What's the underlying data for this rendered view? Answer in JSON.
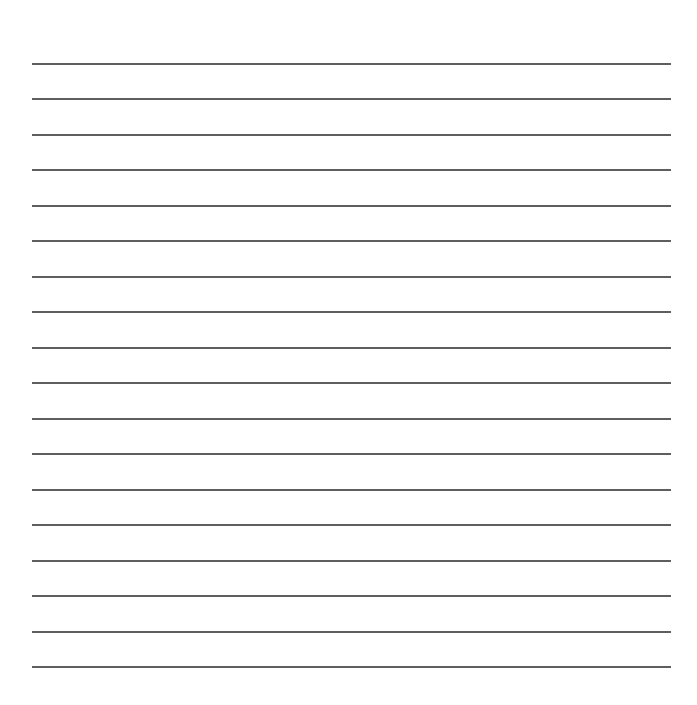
{
  "document": {
    "type": "lined-paper",
    "background_color": "#ffffff",
    "line_color": "#5e5e5e",
    "line_count": 18,
    "first_line_y": 63,
    "line_spacing": 35.47,
    "line_left": 32,
    "line_right": 671,
    "lines": [
      {
        "text": ""
      },
      {
        "text": ""
      },
      {
        "text": ""
      },
      {
        "text": ""
      },
      {
        "text": ""
      },
      {
        "text": ""
      },
      {
        "text": ""
      },
      {
        "text": ""
      },
      {
        "text": ""
      },
      {
        "text": ""
      },
      {
        "text": ""
      },
      {
        "text": ""
      },
      {
        "text": ""
      },
      {
        "text": ""
      },
      {
        "text": ""
      },
      {
        "text": ""
      },
      {
        "text": ""
      },
      {
        "text": ""
      }
    ]
  }
}
